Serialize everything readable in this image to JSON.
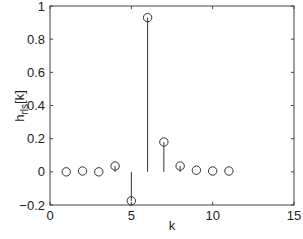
{
  "chart_data": {
    "type": "stem",
    "title": "",
    "xlabel": "k",
    "ylabel": "h_rls[k]",
    "xlim": [
      0,
      15
    ],
    "ylim": [
      -0.2,
      1
    ],
    "xticks": [
      0,
      5,
      10,
      15
    ],
    "yticks": [
      -0.2,
      0,
      0.2,
      0.4,
      0.6,
      0.8,
      1
    ],
    "ytick_labels": [
      "-0.2",
      "0",
      "0.2",
      "0.4",
      "0.6",
      "0.8",
      "1"
    ],
    "xtick_labels": [
      "0",
      "5",
      "10",
      "15"
    ],
    "grid": false,
    "legend": null,
    "x": [
      1,
      2,
      3,
      4,
      5,
      6,
      7,
      8,
      9,
      10,
      11
    ],
    "values": [
      0.0,
      0.005,
      0.0,
      0.035,
      -0.175,
      0.93,
      0.18,
      0.035,
      0.01,
      0.005,
      0.005
    ],
    "marker": "open-circle",
    "color": "#333333"
  }
}
